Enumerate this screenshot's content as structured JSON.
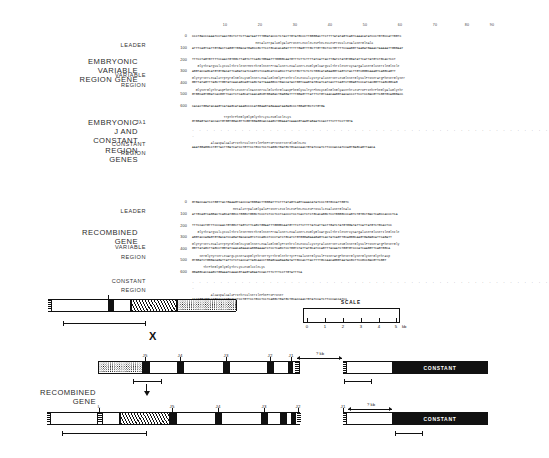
{
  "figure": {
    "groups": [
      {
        "name": "embryonic-variable-region-gene",
        "title_lines": [
          "EMBRYONIC",
          "VARIABLE",
          "REGION GENE"
        ],
        "sub_labels": [
          "LEADER",
          "VARIABLE",
          "REGION"
        ]
      },
      {
        "name": "embryonic-j-and-constant-region-genes",
        "title_lines": [
          "EMBRYONIC",
          "J AND",
          "CONSTANT",
          "REGION",
          "GENES"
        ],
        "sub_labels": [
          "Jλ1",
          "CONSTANT",
          "REGION"
        ]
      },
      {
        "name": "recombined-gene",
        "title_lines": [
          "RECOMBINED",
          "GENE"
        ],
        "sub_labels": [
          "LEADER",
          "VARIABLE",
          "REGION",
          "CONSTANT",
          "REGION"
        ]
      }
    ],
    "ruler_ticks": [
      "10",
      "20",
      "30",
      "40",
      "50",
      "60",
      "70",
      "80",
      "90"
    ],
    "row_numbers_embryonic_v": [
      "0",
      "100",
      "200",
      "300",
      "400",
      "500",
      "600"
    ],
    "row_numbers_recombined": [
      "0",
      "100",
      "200",
      "300",
      "400",
      "500",
      "600"
    ],
    "sequences": {
      "embryonic_variable": [
        {
          "num": "0",
          "protein": "",
          "dna": "CCCTGACCCAAATCCTAACTGCTCTTCTTAATAATTTTGGATACCCTCTACTTGTATGCCCTTGGGGACTTCTTTTATATAGTCAGTCAAACATATCCCTGTGCCATTGGTC"
        },
        {
          "num": "100",
          "protein": "                                  MetAlaTrpAlaGlyAlaProSerLeuIleLeuPheLeuLeuProValLeuAlaSerGlnAla",
          "dna": "ATTTCAGTCATTGTGACTCAGGTTGGACATGAGCCGCTTCCTGCACACAGATTTTTTGAGTTTGCTTGTTGCTCCTGTTTTCCAAGGTTAAGATGAAACTAAAAATTGGGAAT"
        },
        {
          "num": "200",
          "protein": "",
          "dna": "TTTCCTAGTGTTTTCCAACTGTGGCTTAGTCTTCAGCTGGAATTTGGGGCAATGTTTCTTCTTTTATCATTACTTGATCTATGTGGATATTCATTATGTCTGCACTCCT"
        },
        {
          "num": "300",
          "protein": "   GlyThrArgValLysValThrIleSerMetThrGlnSerProAlaSerLeuAlaSerLeuGlyGluArgValThrIleSerCysArgAlaSerGluSerIleGlnIle",
          "dna": "AGGTACCAGCATGTGTGACATTCAGATCATCCAGTCTCCAGCATCCAGCCTTATCTGCTTCTCTCTGGCATAGAAGGTCAGTCTACTTGTCGGGCAAAGTCAGGCAGTT"
        },
        {
          "num": "400",
          "protein": "GlyTyrSerLeuAlaTrpTyrGlnGlnLysGlnSerLeuAlaGlnGlyProThrIleLeuValLysTyrAlaSerSerLeuGlnSerGlyValProSerArgPheSerGlySer",
          "dna": "GGTTATAGTTTAGCTTGGTATCAACAGCAGTCAGCTATTAAAGGCCTGACCATACTGGTCAAGTATGCATCATCACTTCAGTCTGGAGTCCCATCACGGTTCAGCGGCAG"
        },
        {
          "num": "500",
          "protein": "  GlySerGlyThrAspPheThrLeuSerIleAsnSerValGluThrGluAspPheGlyValTyrPheCysGlnGlnGlyAsnThrLeuProProThrPheGlyAlaGlyThr",
          "dna": "GTGGCAGTGGATCACGGTTCACTCTCAGCATCAACAGCGTGGAGACTGAGGATTTTGGAGTTTATTTCTGTCAACAAGGTAACACCCTTCCTCCGACGTTCGGTGCAGGGACC"
        },
        {
          "num": "600",
          "protein": "",
          "dna": "CACACTGGATACAAGTCATAAGCATAAAGCCCCATGGAAGTAGAAAATAAGAGCCCTGGAGTGCTCTGTGA"
        }
      ],
      "embryonic_j_constant": [
        {
          "num": "",
          "protein": "                 TrpThrPheGlyGlyGlyThrLysLeuGluIleLys",
          "dna": "GTGGAGTACTACCACTGTGGTGGACGTTCGGTGGAGGCACCAAGCTGGAAATCAAACGTAAGTAGAATCCACTTTCTTTCCTTGTA"
        },
        {
          "num": "",
          "protein": "",
          "dna": "",
          "dotted": true
        },
        {
          "num": "",
          "protein": "          AlaAspAlaAlaProThrValSerIlePheProProSerSerGluGlnLeu",
          "dna": "AAATGGAGGCCTGTTACTTGATCATCCTGTTCCTGCCTCCTCAGGCTGATGCTGCACCAACTGTATCCATCTTCCCACCATCCAGTGAGCAGTTAACA"
        }
      ],
      "recombined": [
        {
          "num": "0",
          "protein": "",
          "dna": "GTGACCAATCCTGGTTACTGAAAGTCACCCATGGGACTTGGGATTTCTTTATAGTCAGTCAAACATATCCCTGTGCCATTGGTC"
        },
        {
          "num": "100",
          "protein": "                      MetAlaTrpAlaGlyAlaProSerLeuIleLeuPheLeuLeuProValLeuAlaSerGlnAla",
          "dna": "ATTGCAGTCAGGACTCAGCATGGCCTGGGCTGGGCTCCCTCTCCTCCTCACCCTCCTCACTCTCTGCACAGGCTCCTGGGGCCCAGTCTGTGCTGACTCAGCCACCCTCA"
        },
        {
          "num": "200",
          "protein": "",
          "dna": "TTTCCACTGTTTCCCAACTGTGGCTTAGTCTTCAGCTGGAATTTGGGGCAATGTTTCTTCTTTTATCATTACTTGATCTATGTGGATATTCATTATGTCTGCACTCC"
        },
        {
          "num": "300",
          "protein": "   GlyThrArgValLysValThrIleSerMetThrGlnSerProAlaSerLeuAlaSerLeuGlyGluArgValThrIleSerCysArgAlaSerGluSerIleGlnIle",
          "dna": "AGGTACCAGAGTGTGACATCCAGATGACACAGTCTCCAGCCTCCCTATCTGCATCTGTGGGAGAAAGAGTCACTATCAGTTGCAGGGCAAGTGAGAGCATTCAGATT"
        },
        {
          "num": "400",
          "protein": "GlyTyrSerLeuAlaTrpTyrGlnGlnLysGlnSerLeuAlaGlnGlyProThrIleLeuValLysTyrAlaSerSerLeuGlnSerGlyValProSerArgPheSerGly",
          "dna": "GGTTATAGCTTAGCCTGGTATCAACAGAAACAGGGAAAATCTCCTCAGCTCCTGGTCTATTATGCATCCAGTTTACAATCTGGTGTCCCATCAAGGTTCAGTGGCA"
        },
        {
          "num": "500",
          "protein": "    SerGlyTyrSerLeuArgLysSerAspGlyThrSerTyrThrGlnThrTyrProAlaSerGlyValProSerArgPheSerGlySerGlySerGlyThrAsp",
          "dna": "GTGGATCTGGGACAGATTATTCTCTCACCATTAGCAACCTGGAGCAAGAAGATATTGCCACTTACTTTTGCCAACAGGGTAATACGCTTCCGCCGACGTTCGGT"
        },
        {
          "num": "600",
          "protein": "      ThrPheGlyGlyGlyThrLysLeuGluIleLys",
          "dna": "GGAGGCACCAAGCTGGAAATCAAACGTAAGTAGAATCCACTTTCTTTCCTTGTATTTCA"
        },
        {
          "num": "",
          "protein": "",
          "dna": "",
          "dotted": true
        },
        {
          "num": "",
          "protein": "          AlaAspAlaAlaProThrValSerIlePheProProSer",
          "dna": "AAATGGAGGCCTGTTACTTGATCATCCTGTTCCTGCCTCCTCAGGCTGATGCTGCACCAACTGTATCCATCTTCCCACCATCC"
        }
      ]
    },
    "maps": {
      "embryonic_v_map": {
        "name": "embryonic-variable-gene-map"
      },
      "x_symbol": "X",
      "scale": {
        "title": "SCALE",
        "ticks": [
          "0",
          "1",
          "2",
          "3",
          "4",
          "5"
        ],
        "unit": "kb"
      },
      "embryonic_j_c_map": {
        "j_labels": [
          "J5",
          "J4",
          "J3",
          "J2",
          "J1"
        ],
        "gap_label": "? kb",
        "constant_label": "CONSTANT"
      },
      "recombined_map": {
        "leader_label": "L",
        "j_labels": [
          "J5",
          "J4",
          "J3",
          "J2",
          "J1"
        ],
        "gap_label": "? kb",
        "constant_label": "CONSTANT"
      }
    }
  }
}
